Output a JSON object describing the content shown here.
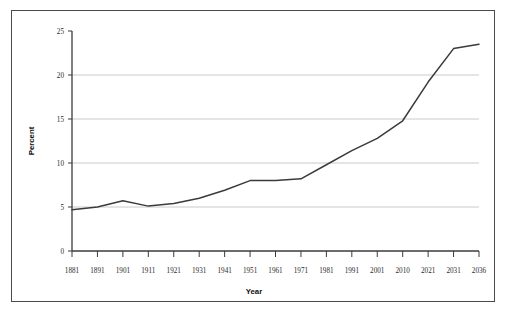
{
  "chart_data": {
    "type": "line",
    "title": "",
    "xlabel": "Year",
    "ylabel": "Percent",
    "categories": [
      "1881",
      "1891",
      "1901",
      "1911",
      "1921",
      "1931",
      "1941",
      "1951",
      "1961",
      "1971",
      "1981",
      "1991",
      "2001",
      "2010",
      "2021",
      "2031",
      "2036"
    ],
    "values": [
      4.7,
      5.0,
      5.7,
      5.1,
      5.4,
      6.0,
      6.9,
      8.0,
      8.0,
      8.2,
      9.8,
      11.4,
      12.8,
      14.8,
      19.2,
      23.0,
      23.5
    ],
    "series": [
      {
        "name": "Percent",
        "values": [
          4.7,
          5.0,
          5.7,
          5.1,
          5.4,
          6.0,
          6.9,
          8.0,
          8.0,
          8.2,
          9.8,
          11.4,
          12.8,
          14.8,
          19.2,
          23.0,
          23.5
        ]
      }
    ],
    "ylim": [
      0,
      25
    ],
    "yticks": [
      0,
      5,
      10,
      15,
      20,
      25
    ],
    "ytick_labels": [
      "0",
      "5",
      "10",
      "15",
      "20",
      "25"
    ],
    "grid": "horizontal",
    "legend": "none",
    "line_color": "#3b3b3b",
    "grid_color": "#bcbcbc",
    "axis_color": "#3b3b3b",
    "border_color": "#4a4a4a"
  },
  "axes": {
    "x_title": "Year",
    "y_title": "Percent"
  }
}
